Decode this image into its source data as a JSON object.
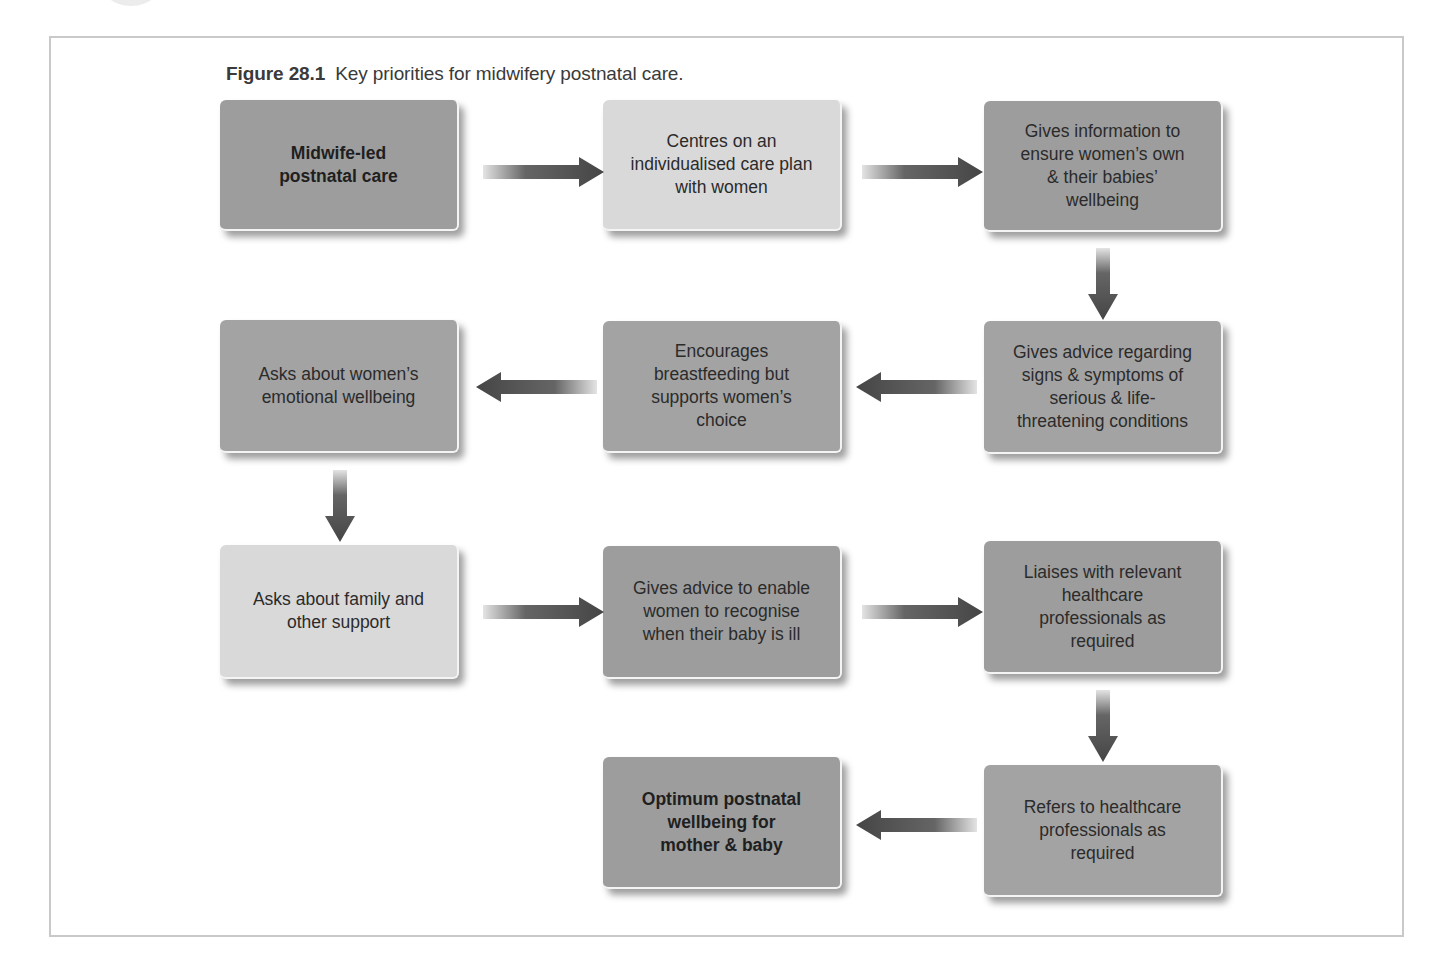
{
  "figure": {
    "number": "Figure 28.1",
    "title": "Key priorities for midwifery postnatal care."
  },
  "colors": {
    "dark_box": "#9d9d9d",
    "light_box": "#d9d9d9",
    "arrow": "#4a4a4a",
    "frame": "#c9c9c9"
  },
  "nodes": [
    {
      "id": 1,
      "text": "Midwife-led postnatal care",
      "shade": "dark",
      "bold": true
    },
    {
      "id": 2,
      "text": "Centres on an individualised care plan with women",
      "shade": "light",
      "bold": false
    },
    {
      "id": 3,
      "text": "Gives information to ensure women’s own & their babies’ wellbeing",
      "shade": "dark",
      "bold": false
    },
    {
      "id": 4,
      "text": "Gives advice regarding signs & symptoms of serious & life-threatening conditions",
      "shade": "dark",
      "bold": false
    },
    {
      "id": 5,
      "text": "Encourages breastfeeding but supports women’s choice",
      "shade": "dark",
      "bold": false
    },
    {
      "id": 6,
      "text": "Asks about women’s emotional wellbeing",
      "shade": "dark",
      "bold": false
    },
    {
      "id": 7,
      "text": "Asks about family and other support",
      "shade": "light",
      "bold": false
    },
    {
      "id": 8,
      "text": "Gives advice to enable women to recognise when their baby is ill",
      "shade": "dark",
      "bold": false
    },
    {
      "id": 9,
      "text": "Liaises with relevant healthcare professionals as required",
      "shade": "dark",
      "bold": false
    },
    {
      "id": 10,
      "text": "Refers to healthcare professionals as required",
      "shade": "dark",
      "bold": false
    },
    {
      "id": 11,
      "text": "Optimum postnatal wellbeing for mother & baby",
      "shade": "dark",
      "bold": true
    }
  ],
  "edges": [
    {
      "from": 1,
      "to": 2,
      "direction": "right"
    },
    {
      "from": 2,
      "to": 3,
      "direction": "right"
    },
    {
      "from": 3,
      "to": 4,
      "direction": "down"
    },
    {
      "from": 4,
      "to": 5,
      "direction": "left"
    },
    {
      "from": 5,
      "to": 6,
      "direction": "left"
    },
    {
      "from": 6,
      "to": 7,
      "direction": "down"
    },
    {
      "from": 7,
      "to": 8,
      "direction": "right"
    },
    {
      "from": 8,
      "to": 9,
      "direction": "right"
    },
    {
      "from": 9,
      "to": 10,
      "direction": "down"
    },
    {
      "from": 10,
      "to": 11,
      "direction": "left"
    }
  ],
  "lines": {
    "n1": [
      "Midwife-led",
      "postnatal care"
    ],
    "n2": [
      "Centres on an",
      "individualised care plan",
      "with women"
    ],
    "n3": [
      "Gives information to",
      "ensure women’s own",
      "& their babies’",
      "wellbeing"
    ],
    "n4": [
      "Gives advice regarding",
      "signs & symptoms of",
      "serious & life-",
      "threatening conditions"
    ],
    "n5": [
      "Encourages",
      "breastfeeding but",
      "supports women’s",
      "choice"
    ],
    "n6": [
      "Asks about women’s",
      "emotional wellbeing"
    ],
    "n7": [
      "Asks about family and",
      "other support"
    ],
    "n8": [
      "Gives advice to enable",
      "women to recognise",
      "when their baby is ill"
    ],
    "n9": [
      "Liaises with relevant",
      "healthcare",
      "professionals as",
      "required"
    ],
    "n10": [
      "Refers to healthcare",
      "professionals as",
      "required"
    ],
    "n11": [
      "Optimum postnatal",
      "wellbeing for",
      "mother & baby"
    ]
  }
}
